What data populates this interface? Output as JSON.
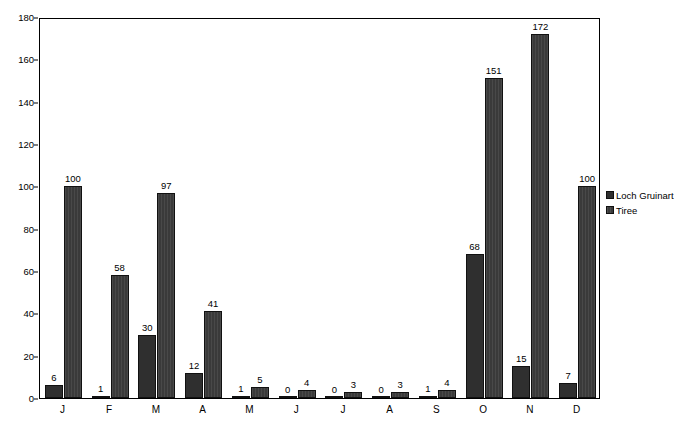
{
  "chart_data": {
    "type": "bar",
    "title": "",
    "subtitle": "",
    "xlabel": "",
    "ylabel": "",
    "ylim": [
      0,
      180
    ],
    "ytick_step": 20,
    "yticks": [
      0,
      20,
      40,
      60,
      80,
      100,
      120,
      140,
      160,
      180
    ],
    "grid": false,
    "legend_position": "right",
    "data_labels": true,
    "categories": [
      "J",
      "F",
      "M",
      "A",
      "M",
      "J",
      "J",
      "A",
      "S",
      "O",
      "N",
      "D"
    ],
    "series": [
      {
        "name": "Loch Gruinart",
        "color": "#2f2f2f",
        "values": [
          6,
          1,
          30,
          12,
          1,
          0,
          0,
          0,
          1,
          68,
          15,
          7
        ]
      },
      {
        "name": "Tiree",
        "color": "#3a3a3a",
        "values": [
          100,
          58,
          97,
          41,
          5,
          4,
          3,
          3,
          4,
          151,
          172,
          100
        ]
      }
    ]
  },
  "legend": {
    "entries": [
      {
        "label": "Loch Gruinart"
      },
      {
        "label": "Tiree"
      }
    ]
  },
  "colors": {
    "series_1": "#2f2f2f",
    "series_2": "#3a3a3a",
    "axis": "#000000",
    "background": "#ffffff"
  }
}
